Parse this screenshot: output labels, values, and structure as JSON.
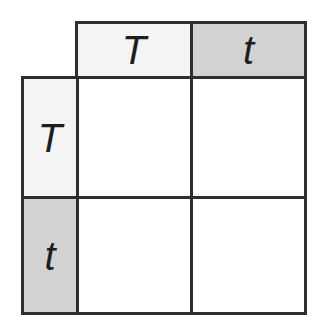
{
  "columns": [
    {
      "allele": "T",
      "shade": "#f4f4f4"
    },
    {
      "allele": "t",
      "shade": "#d2d2d2"
    }
  ],
  "rows": [
    {
      "allele": "T",
      "shade": "#f4f4f4"
    },
    {
      "allele": "t",
      "shade": "#d2d2d2"
    }
  ],
  "cells": [
    [
      "",
      ""
    ],
    [
      "",
      ""
    ]
  ]
}
